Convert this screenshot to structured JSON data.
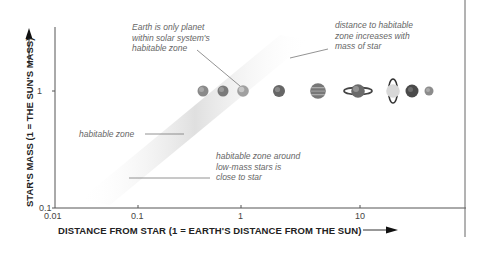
{
  "axes": {
    "x_label": "DISTANCE FROM STAR (1 = EARTH'S DISTANCE FROM THE SUN)",
    "y_label": "STAR'S MASS (1 = THE SUN'S MASS)",
    "x_ticks": [
      "0.01",
      "0.1",
      "1",
      "10"
    ],
    "y_ticks": [
      "0.1",
      "1"
    ]
  },
  "annotations": {
    "earth": [
      "Earth is only planet",
      "within solar system's",
      "habitable zone"
    ],
    "distance": [
      "distance to habitable",
      "zone increases with",
      "mass of star"
    ],
    "zone": "habitable zone",
    "low_mass": [
      "habitable zone around",
      "low-mass stars is",
      "close to star"
    ]
  },
  "planets": [
    {
      "name": "Mercury",
      "color": "#8a8a8a"
    },
    {
      "name": "Venus",
      "color": "#7a7a7a"
    },
    {
      "name": "Earth",
      "color": "#a0a0a0"
    },
    {
      "name": "Mars",
      "color": "#666666"
    },
    {
      "name": "Jupiter",
      "color": "#777777"
    },
    {
      "name": "Saturn",
      "color": "#6a6a6a"
    },
    {
      "name": "Uranus",
      "color": "#bdbdbd"
    },
    {
      "name": "Neptune",
      "color": "#4a4a4a"
    },
    {
      "name": "Pluto",
      "color": "#8c8c8c"
    }
  ],
  "colors": {
    "axis": "#555555",
    "zone": "#e6e6e6",
    "text": "#666666"
  }
}
